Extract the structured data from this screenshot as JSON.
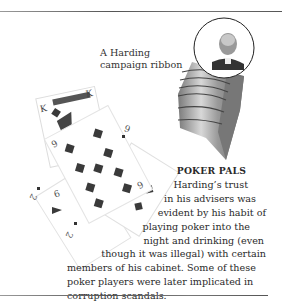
{
  "figure": {
    "caption": {
      "line1": "A Harding",
      "line2": "campaign ribbon"
    },
    "image_ribbon": "campaign-ribbon-with-portrait",
    "image_cards": "playing-cards-king-9-10-2-diamonds"
  },
  "sidebar": {
    "heading": "POKER PALS",
    "lines": [
      "Harding’s trust",
      "in his advisers was",
      "evident by his habit of",
      "playing poker into the",
      "night and drinking (even",
      "though it was illegal) with certain",
      "members of his cabinet. Some of these",
      "poker players were later implicated in",
      "corruption scandals."
    ]
  },
  "colors": {
    "text": "#2a2a2a",
    "rule": "#666666",
    "card_ink": "#3a3a3a"
  }
}
